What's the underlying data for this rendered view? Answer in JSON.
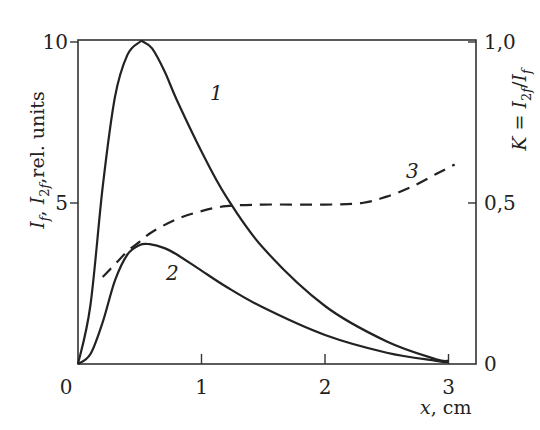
{
  "chart_data": {
    "type": "line",
    "title": "",
    "xlabel": "x, cm",
    "ylabel": "I_f, I_2f, rel. units",
    "ylabel_right": "K = I_2f / I_f",
    "xlim": [
      0,
      3.2
    ],
    "ylim": [
      0,
      10.4
    ],
    "ylim_right": [
      0,
      1.04
    ],
    "x_ticks": [
      "0",
      "1",
      "2",
      "3"
    ],
    "y_ticks": [
      "0",
      "5",
      "10"
    ],
    "y_ticks_right": [
      "0",
      "0,5",
      "1,0"
    ],
    "grid": false,
    "legend": "inline curve labels",
    "series": [
      {
        "name": "1",
        "axis": "left",
        "style": "solid",
        "x": [
          0,
          0.1,
          0.2,
          0.3,
          0.4,
          0.5,
          0.53,
          0.6,
          0.7,
          0.8,
          1.0,
          1.2,
          1.5,
          2.0,
          2.5,
          2.9,
          3.0
        ],
        "y": [
          0,
          1.8,
          5.5,
          8.3,
          9.6,
          10.0,
          10.0,
          9.8,
          9.1,
          8.2,
          6.6,
          5.2,
          3.6,
          1.8,
          0.7,
          0.15,
          0.1
        ]
      },
      {
        "name": "2",
        "axis": "left",
        "style": "solid",
        "x": [
          0,
          0.1,
          0.2,
          0.3,
          0.4,
          0.5,
          0.58,
          0.7,
          0.8,
          1.0,
          1.2,
          1.5,
          2.0,
          2.5,
          2.9,
          3.0
        ],
        "y": [
          0,
          0.3,
          1.3,
          2.6,
          3.4,
          3.7,
          3.72,
          3.6,
          3.4,
          2.9,
          2.4,
          1.75,
          0.9,
          0.35,
          0.1,
          0.05
        ]
      },
      {
        "name": "3",
        "axis": "right",
        "style": "dashed",
        "x": [
          0.2,
          0.3,
          0.4,
          0.5,
          0.6,
          0.8,
          1.0,
          1.2,
          1.5,
          2.0,
          2.3,
          2.5,
          2.7,
          2.9,
          3.05
        ],
        "y": [
          0.27,
          0.31,
          0.35,
          0.38,
          0.41,
          0.45,
          0.475,
          0.49,
          0.495,
          0.495,
          0.5,
          0.52,
          0.55,
          0.59,
          0.62
        ]
      }
    ],
    "annotations": [
      "1",
      "2",
      "3"
    ]
  }
}
